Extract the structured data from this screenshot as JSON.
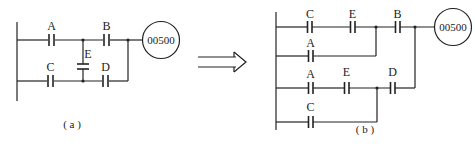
{
  "diagram_a": {
    "caption": "( a )",
    "coil": "00500",
    "contacts": {
      "A": "A",
      "B": "B",
      "C": "C",
      "D": "D",
      "E": "E"
    }
  },
  "diagram_b": {
    "caption": "( b )",
    "coil": "00500",
    "rung1": {
      "c1": "C",
      "c2": "E",
      "c3": "B"
    },
    "rung2": {
      "c1": "A"
    },
    "rung3": {
      "c1": "A",
      "c2": "E",
      "c3": "D"
    },
    "rung4": {
      "c1": "C"
    }
  },
  "arrow": {
    "icon": "double-arrow-right-icon"
  },
  "colors": {
    "line": "#222222",
    "background": "#ffffff"
  }
}
